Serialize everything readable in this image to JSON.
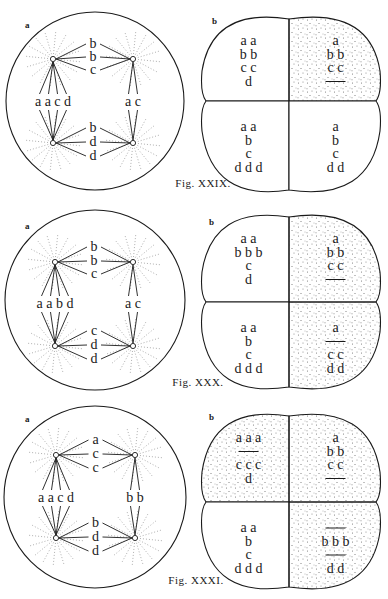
{
  "colors": {
    "ink": "#1a1a1a",
    "background": "#ffffff",
    "aster": "#9a9a9a",
    "stipple": "#6e6e6e"
  },
  "figures": [
    {
      "caption": "Fig. XXIX.",
      "caption_pos": [
        203,
        187
      ],
      "a": {
        "label": "a",
        "label_pos": [
          25,
          28
        ],
        "circle": {
          "cx": 95,
          "cy": 101,
          "r": 89
        },
        "poles": [
          [
            53,
            59
          ],
          [
            133,
            59
          ],
          [
            53,
            143
          ],
          [
            133,
            143
          ]
        ],
        "top_labels": [
          "b",
          "b",
          "c"
        ],
        "top_ys": [
          48,
          61,
          74
        ],
        "bottom_labels": [
          "b",
          "d",
          "d"
        ],
        "bottom_ys": [
          132,
          146,
          160
        ],
        "left_label": "a a c d",
        "right_label": "a c",
        "mid_y": 106
      },
      "b": {
        "label": "b",
        "label_pos": [
          212,
          24
        ],
        "box": {
          "x1": 202,
          "x2": 380,
          "y1": 13,
          "y2": 196,
          "mx": 289,
          "my": 101
        },
        "stippled": [
          false,
          true,
          false,
          false
        ],
        "cells": [
          {
            "lines": [
              "a a",
              "b b",
              "c c",
              "d"
            ]
          },
          {
            "lines": [
              "a",
              "b b",
              "c c",
              "—"
            ]
          },
          {
            "lines": [
              "a a",
              "b",
              "c",
              "d d d"
            ]
          },
          {
            "lines": [
              "a",
              "b",
              "c",
              "d d"
            ]
          }
        ]
      }
    },
    {
      "caption": "Fig. XXX.",
      "caption_pos": [
        198,
        386
      ],
      "a": {
        "label": "a",
        "label_pos": [
          25,
          229
        ],
        "circle": {
          "cx": 95,
          "cy": 300,
          "r": 90
        },
        "poles": [
          [
            55,
            262
          ],
          [
            133,
            262
          ],
          [
            55,
            346
          ],
          [
            133,
            346
          ]
        ],
        "top_labels": [
          "b",
          "b",
          "c"
        ],
        "top_ys": [
          251,
          265,
          278
        ],
        "bottom_labels": [
          "c",
          "d",
          "d"
        ],
        "bottom_ys": [
          335,
          349,
          363
        ],
        "left_label": "a a b d",
        "right_label": "a c",
        "mid_y": 308
      },
      "b": {
        "label": "b",
        "label_pos": [
          209,
          225
        ],
        "box": {
          "x1": 202,
          "x2": 380,
          "y1": 211,
          "y2": 393,
          "mx": 289,
          "my": 302
        },
        "stippled": [
          false,
          true,
          false,
          true
        ],
        "cells": [
          {
            "lines": [
              "a a",
              "b b b",
              "c",
              "d"
            ]
          },
          {
            "lines": [
              "a",
              "b b",
              "c c",
              "—"
            ]
          },
          {
            "lines": [
              "a a",
              "b",
              "c",
              "d d d"
            ]
          },
          {
            "lines": [
              "a",
              "—",
              "c c",
              "d d"
            ]
          }
        ]
      }
    },
    {
      "caption": "Fig. XXXI.",
      "caption_pos": [
        196,
        584
      ],
      "a": {
        "label": "a",
        "label_pos": [
          25,
          422
        ],
        "circle": {
          "cx": 95,
          "cy": 497,
          "r": 91
        },
        "poles": [
          [
            56,
            455
          ],
          [
            135,
            455
          ],
          [
            56,
            538
          ],
          [
            135,
            538
          ]
        ],
        "top_labels": [
          "a",
          "c",
          "c"
        ],
        "top_ys": [
          444,
          458,
          472
        ],
        "bottom_labels": [
          "b",
          "d",
          "d"
        ],
        "bottom_ys": [
          527,
          541,
          555
        ],
        "left_label": "a a c d",
        "right_label": "b b",
        "mid_y": 502
      },
      "b": {
        "label": "b",
        "label_pos": [
          209,
          420
        ],
        "box": {
          "x1": 202,
          "x2": 380,
          "y1": 410,
          "y2": 593,
          "mx": 289,
          "my": 502
        },
        "stippled": [
          true,
          true,
          false,
          true
        ],
        "cells": [
          {
            "lines": [
              "a a a",
              "—",
              "c c c",
              "d"
            ]
          },
          {
            "lines": [
              "a",
              "b b",
              "c c",
              "—"
            ]
          },
          {
            "lines": [
              "a a",
              "b",
              "c",
              "d d d"
            ]
          },
          {
            "lines": [
              "—",
              "b b b",
              "—",
              "d d"
            ]
          }
        ]
      }
    }
  ]
}
